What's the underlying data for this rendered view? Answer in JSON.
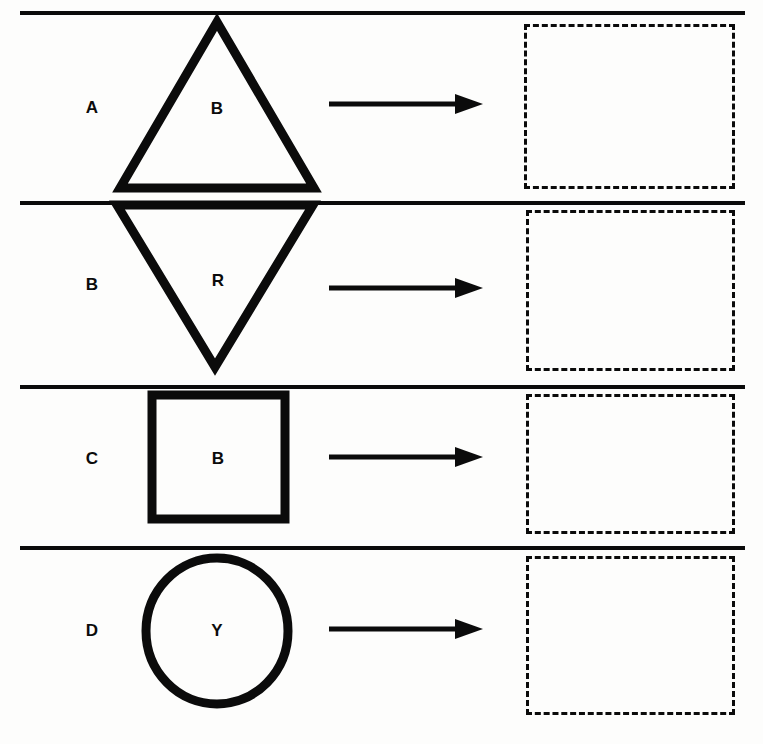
{
  "page": {
    "width": 763,
    "height": 744,
    "background_color": "#fdfdfc",
    "ink_color": "#0b0b0b"
  },
  "dividers": [
    {
      "name": "divider-top",
      "y": 11
    },
    {
      "name": "divider-1",
      "y": 201
    },
    {
      "name": "divider-2",
      "y": 385
    },
    {
      "name": "divider-3",
      "y": 546
    }
  ],
  "rows": [
    {
      "id": "row-a",
      "label": "A",
      "label_x": 72,
      "label_y": 99,
      "shape": {
        "kind": "triangle-up",
        "letter": "B",
        "letter_x": 197,
        "letter_y": 100,
        "x": 120,
        "y": 22,
        "width": 194,
        "height": 166,
        "stroke_width": 9
      },
      "arrow": {
        "x": 329,
        "y": 104,
        "length": 154
      },
      "answer_box": {
        "x": 524,
        "y": 24,
        "width": 211,
        "height": 165
      }
    },
    {
      "id": "row-b",
      "label": "B",
      "label_x": 72,
      "label_y": 276,
      "shape": {
        "kind": "triangle-down",
        "letter": "R",
        "letter_x": 198,
        "letter_y": 272,
        "x": 117,
        "y": 205,
        "width": 196,
        "height": 162,
        "stroke_width": 9
      },
      "arrow": {
        "x": 329,
        "y": 288,
        "length": 154
      },
      "answer_box": {
        "x": 526,
        "y": 210,
        "width": 209,
        "height": 161
      }
    },
    {
      "id": "row-c",
      "label": "C",
      "label_x": 72,
      "label_y": 450,
      "shape": {
        "kind": "square",
        "letter": "B",
        "letter_x": 198,
        "letter_y": 450,
        "x": 152,
        "y": 395,
        "width": 133,
        "height": 124,
        "stroke_width": 9
      },
      "arrow": {
        "x": 329,
        "y": 457,
        "length": 154
      },
      "answer_box": {
        "x": 526,
        "y": 394,
        "width": 209,
        "height": 140
      }
    },
    {
      "id": "row-d",
      "label": "D",
      "label_x": 72,
      "label_y": 622,
      "shape": {
        "kind": "circle",
        "letter": "Y",
        "letter_x": 197,
        "letter_y": 622,
        "x": 146,
        "y": 558,
        "width": 142,
        "height": 146,
        "stroke_width": 9
      },
      "arrow": {
        "x": 329,
        "y": 629,
        "length": 154
      },
      "answer_box": {
        "x": 526,
        "y": 556,
        "width": 209,
        "height": 159
      }
    }
  ],
  "legend": {
    "shape_codes": [
      "B",
      "R",
      "Y"
    ],
    "row_codes": [
      "A",
      "B",
      "C",
      "D"
    ]
  }
}
